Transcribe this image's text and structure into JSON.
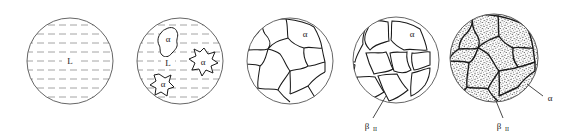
{
  "figure": {
    "background_color": "#ffffff",
    "line_color": "#1a1a1a",
    "liquid_hatch_color": "#9a9a9a",
    "stipple_color": "#3a3a3a",
    "panel_count": 5
  },
  "labels": {
    "liquid": "L",
    "alpha": "α",
    "beta": "β",
    "beta_subscript": "II"
  },
  "panels": [
    {
      "id": "panel-1",
      "name": "liquid-only",
      "center_x": 70,
      "center_y": 61,
      "radius": 43,
      "fill": "liquid-hatch",
      "labels": [
        {
          "text": "L",
          "x": 70,
          "y": 64,
          "leader": false
        }
      ],
      "hatch_line_count": 11,
      "hatch_spacing": 9
    },
    {
      "id": "panel-2",
      "name": "alpha-nuclei-in-liquid",
      "center_x": 180,
      "center_y": 61,
      "radius": 43,
      "fill": "liquid-hatch",
      "labels": [
        {
          "text": "L",
          "x": 168,
          "y": 66,
          "leader": false
        },
        {
          "text": "α",
          "x": 168,
          "y": 42,
          "leader": false
        },
        {
          "text": "α",
          "x": 203,
          "y": 62,
          "leader": false
        },
        {
          "text": "α",
          "x": 165,
          "y": 85,
          "leader": false
        }
      ],
      "blob_count": 3,
      "hatch_line_count": 11,
      "hatch_spacing": 9
    },
    {
      "id": "panel-3",
      "name": "alpha-grains",
      "center_x": 290,
      "center_y": 61,
      "radius": 43,
      "fill": "white",
      "labels": [
        {
          "text": "α",
          "x": 305,
          "y": 36,
          "leader": false
        }
      ],
      "grain_count": 11
    },
    {
      "id": "panel-4",
      "name": "beta-at-grain-boundaries",
      "center_x": 396,
      "center_y": 60,
      "radius": 43,
      "fill": "white",
      "labels": [
        {
          "text": "α",
          "x": 412,
          "y": 36,
          "leader": false
        },
        {
          "text": "β",
          "x": 368,
          "y": 127,
          "leader": true,
          "leader_x1": 373,
          "leader_y1": 118,
          "leader_x2": 386,
          "leader_y2": 96,
          "subscript": "II"
        }
      ],
      "grain_count": 10,
      "boundary_style": "thick-band"
    },
    {
      "id": "panel-5",
      "name": "eutectoid-stippled-grains",
      "center_x": 494,
      "center_y": 58,
      "radius": 44,
      "fill": "stipple",
      "labels": [
        {
          "text": "α",
          "x": 548,
          "y": 100,
          "leader": true,
          "leader_x1": 543,
          "leader_y1": 96,
          "leader_x2": 527,
          "leader_y2": 84
        },
        {
          "text": "β",
          "x": 500,
          "y": 127,
          "leader": true,
          "leader_x1": 503,
          "leader_y1": 118,
          "leader_x2": 494,
          "leader_y2": 96,
          "subscript": "II"
        }
      ],
      "grain_count": 10,
      "stipple_density": "high"
    }
  ]
}
